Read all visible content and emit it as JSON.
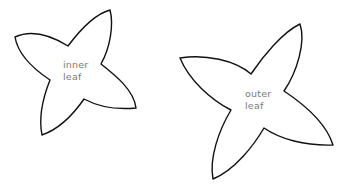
{
  "diagram": {
    "shapes": [
      {
        "id": "inner",
        "label_lines": [
          "inner",
          "leaf"
        ],
        "stroke_color": "#111111",
        "fill_color": "#ffffff",
        "text_color": "#7a7a7a"
      },
      {
        "id": "outer",
        "label_lines": [
          "outer",
          "leaf"
        ],
        "stroke_color": "#111111",
        "fill_color": "#ffffff",
        "text_color": "#7a7a7a"
      }
    ]
  }
}
